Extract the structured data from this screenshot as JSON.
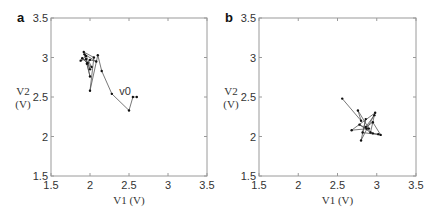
{
  "chart_data": [
    {
      "type": "line",
      "panel_label": "a",
      "title": "",
      "xlabel": "V1 (V)",
      "ylabel": "V2 (V)",
      "xlim": [
        1.5,
        3.5
      ],
      "ylim": [
        1.5,
        3.5
      ],
      "xticks": [
        "1.5",
        "2",
        "2.5",
        "3",
        "3.5"
      ],
      "yticks": [
        "1.5",
        "2",
        "2.5",
        "3",
        "3.5"
      ],
      "grid": false,
      "annotation": {
        "text": "v0",
        "x": 2.45,
        "y": 2.52
      },
      "series": [
        {
          "name": "trajectory",
          "x": [
            2.6,
            2.55,
            2.5,
            2.28,
            2.15,
            2.1,
            2.0,
            2.05,
            1.92,
            2.0,
            1.95,
            1.88,
            1.95,
            2.02,
            1.9,
            1.97,
            2.0,
            1.93,
            2.08,
            2.0,
            1.96
          ],
          "y": [
            2.5,
            2.5,
            2.33,
            2.54,
            2.83,
            3.03,
            2.58,
            3.0,
            3.07,
            2.76,
            2.98,
            2.96,
            3.02,
            2.88,
            2.99,
            2.93,
            2.85,
            3.04,
            2.95,
            2.97,
            2.92
          ]
        }
      ]
    },
    {
      "type": "line",
      "panel_label": "b",
      "title": "",
      "xlabel": "V1 (V)",
      "ylabel": "V2 (V)",
      "xlim": [
        1.5,
        3.5
      ],
      "ylim": [
        1.5,
        3.5
      ],
      "xticks": [
        "1.5",
        "2",
        "2.5",
        "3",
        "3.5"
      ],
      "yticks": [
        "1.5",
        "2",
        "2.5",
        "3",
        "3.5"
      ],
      "grid": false,
      "series": [
        {
          "name": "trajectory",
          "x": [
            2.56,
            2.8,
            2.76,
            2.9,
            2.68,
            2.98,
            2.8,
            2.86,
            2.82,
            3.05,
            2.95,
            2.86,
            2.97,
            2.92,
            2.78,
            2.87,
            2.95,
            3.02
          ],
          "y": [
            2.48,
            2.2,
            2.33,
            2.1,
            2.08,
            2.3,
            1.95,
            2.22,
            2.05,
            2.02,
            2.18,
            2.12,
            2.27,
            2.05,
            2.15,
            2.1,
            2.04,
            2.03
          ]
        }
      ]
    }
  ],
  "panels": {
    "a": {
      "label": "a",
      "annotation": "v0",
      "xlabel": "V1 (V)",
      "ylabel_line1": "V2",
      "ylabel_line2": "(V)"
    },
    "b": {
      "label": "b",
      "xlabel": "V1 (V)",
      "ylabel_line1": "V2",
      "ylabel_line2": "(V)"
    }
  },
  "colors": {
    "frame": "#9a9a9a",
    "line": "#555555",
    "marker": "#111111"
  }
}
